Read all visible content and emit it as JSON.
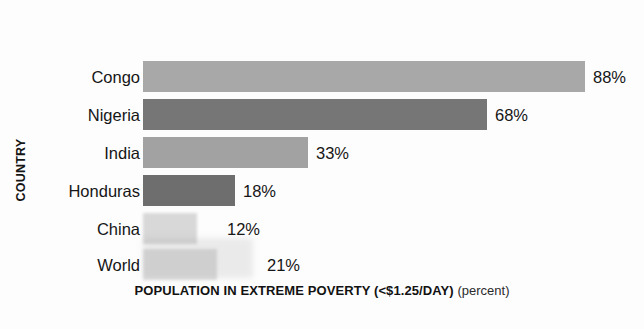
{
  "chart_data": {
    "type": "bar",
    "orientation": "horizontal",
    "title": "",
    "xlabel": "POPULATION IN EXTREME POVERTY (<$1.25/DAY)",
    "xlabel_suffix": "(percent)",
    "ylabel": "COUNTRY",
    "categories": [
      "Congo",
      "Nigeria",
      "India",
      "Honduras",
      "China",
      "World"
    ],
    "values": [
      88,
      68,
      33,
      18,
      12,
      21
    ],
    "value_labels": [
      "88%",
      "68%",
      "33%",
      "18%",
      "12%",
      "21%"
    ],
    "unit": "percent",
    "grid": false,
    "legend": "none",
    "axis_ticks": [],
    "bar_colors": [
      "#a8a8a8",
      "#767676",
      "#a2a2a2",
      "#6e6e6e",
      "#d8d8d8",
      "#dcdcdc"
    ],
    "bar_pixel_widths": [
      442,
      344,
      165,
      92,
      54,
      74
    ],
    "note": "Bar lengths in the scanned source are not strictly proportional to the labelled percentages."
  },
  "bars": [
    {
      "category": "Congo",
      "value_label": "88%",
      "color": "#a8a8a8",
      "width": 442,
      "top": 58,
      "faint": false
    },
    {
      "category": "Nigeria",
      "value_label": "68%",
      "color": "#767676",
      "width": 344,
      "top": 96,
      "faint": false
    },
    {
      "category": "India",
      "value_label": "33%",
      "color": "#a2a2a2",
      "width": 165,
      "top": 134,
      "faint": false
    },
    {
      "category": "Honduras",
      "value_label": "18%",
      "color": "#6e6e6e",
      "width": 92,
      "top": 172,
      "faint": false
    },
    {
      "category": "China",
      "value_label": "12%",
      "color": "#d8d8d8",
      "width": 54,
      "top": 210,
      "faint": true
    },
    {
      "category": "World",
      "value_label": "21%",
      "color": "#dcdcdc",
      "width": 74,
      "top": 246,
      "faint": true
    }
  ],
  "label_offsets": [
    8,
    8,
    8,
    8,
    30,
    50
  ]
}
